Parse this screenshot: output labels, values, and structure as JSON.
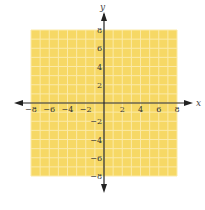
{
  "chart_data": {
    "type": "scatter",
    "title": "",
    "xlabel": "x",
    "ylabel": "y",
    "xlim": [
      -8,
      8
    ],
    "ylim": [
      -8,
      8
    ],
    "grid": true,
    "grid_step": 1,
    "x_ticks": [
      -8,
      -6,
      -4,
      -2,
      2,
      4,
      6,
      8
    ],
    "y_ticks": [
      8,
      6,
      4,
      2,
      -2,
      -4,
      -6,
      -8
    ],
    "x_tick_labels": [
      "−8",
      "−6",
      "−4",
      "−2",
      "2",
      "4",
      "6",
      "8"
    ],
    "y_tick_labels": [
      "8",
      "6",
      "4",
      "2",
      "−2",
      "−4",
      "−6",
      "−8"
    ],
    "series": [],
    "legend": null
  },
  "colors": {
    "grid_background": "#f6d865",
    "grid_lines": "#fbeaa8",
    "axis": "#222222"
  }
}
